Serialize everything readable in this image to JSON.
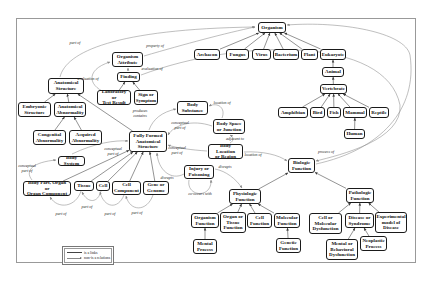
{
  "colors": {
    "box_border": "#1a1a1a",
    "isa_line": "#3a3a3a",
    "rel_line": "#8a8a8a",
    "frame": "#999999"
  },
  "nodes": [
    {
      "id": "organism",
      "label": "Organism",
      "x": 258,
      "y": 22,
      "w": 28,
      "h": 11
    },
    {
      "id": "archaeon",
      "label": "Archaeon",
      "x": 194,
      "y": 49,
      "w": 26,
      "h": 11
    },
    {
      "id": "fungus",
      "label": "Fungus",
      "x": 226,
      "y": 49,
      "w": 23,
      "h": 11
    },
    {
      "id": "virus",
      "label": "Virus",
      "x": 252,
      "y": 49,
      "w": 19,
      "h": 11
    },
    {
      "id": "bacterium",
      "label": "Bacterium",
      "x": 273,
      "y": 49,
      "w": 26,
      "h": 11
    },
    {
      "id": "plant",
      "label": "Plant",
      "x": 301,
      "y": 49,
      "w": 17,
      "h": 11
    },
    {
      "id": "eukaryote",
      "label": "Eukaryote",
      "x": 320,
      "y": 49,
      "w": 26,
      "h": 11
    },
    {
      "id": "animal",
      "label": "Animal",
      "x": 322,
      "y": 67,
      "w": 22,
      "h": 10
    },
    {
      "id": "vertebrate",
      "label": "Vertebrate",
      "x": 320,
      "y": 84,
      "w": 27,
      "h": 10
    },
    {
      "id": "amphibian",
      "label": "Amphibian",
      "x": 278,
      "y": 107,
      "w": 30,
      "h": 11
    },
    {
      "id": "bird",
      "label": "Bird",
      "x": 310,
      "y": 107,
      "w": 15,
      "h": 11
    },
    {
      "id": "fish",
      "label": "Fish",
      "x": 327,
      "y": 107,
      "w": 14,
      "h": 11
    },
    {
      "id": "mammal",
      "label": "Mammal",
      "x": 343,
      "y": 107,
      "w": 24,
      "h": 11
    },
    {
      "id": "reptile",
      "label": "Reptile",
      "x": 369,
      "y": 107,
      "w": 20,
      "h": 11
    },
    {
      "id": "human",
      "label": "Human",
      "x": 344,
      "y": 129,
      "w": 21,
      "h": 10
    },
    {
      "id": "anatomical-structure",
      "label": "Anatomical\nStructure",
      "x": 48,
      "y": 78,
      "w": 36,
      "h": 16
    },
    {
      "id": "organism-attribute",
      "label": "Organism\nAttribute",
      "x": 112,
      "y": 52,
      "w": 31,
      "h": 15
    },
    {
      "id": "finding",
      "label": "Finding",
      "x": 117,
      "y": 72,
      "w": 23,
      "h": 10
    },
    {
      "id": "lab-test",
      "label": "Laboratory or\nTest Result",
      "x": 97,
      "y": 90,
      "w": 34,
      "h": 15
    },
    {
      "id": "sign-symptom",
      "label": "Sign or\nSymptom",
      "x": 134,
      "y": 90,
      "w": 24,
      "h": 15
    },
    {
      "id": "embryonic",
      "label": "Embryonic\nStructure",
      "x": 18,
      "y": 102,
      "w": 33,
      "h": 15
    },
    {
      "id": "anat-abnormality",
      "label": "Anatomical\nAbnormality",
      "x": 54,
      "y": 102,
      "w": 32,
      "h": 15
    },
    {
      "id": "congenital",
      "label": "Congenital\nAbnormality",
      "x": 33,
      "y": 130,
      "w": 33,
      "h": 15
    },
    {
      "id": "acquired",
      "label": "Acquired\nAbnormality",
      "x": 69,
      "y": 130,
      "w": 33,
      "h": 15
    },
    {
      "id": "ffas",
      "label": "Fully Formed\nAnatomical\nStructure",
      "x": 129,
      "y": 131,
      "w": 38,
      "h": 21
    },
    {
      "id": "body-substance",
      "label": "Body\nSubstance",
      "x": 177,
      "y": 101,
      "w": 31,
      "h": 14
    },
    {
      "id": "body-space",
      "label": "Body Space\nor Junction",
      "x": 213,
      "y": 119,
      "w": 32,
      "h": 15
    },
    {
      "id": "body-location",
      "label": "Body Location\nor Region",
      "x": 208,
      "y": 144,
      "w": 35,
      "h": 15
    },
    {
      "id": "body-system",
      "label": "Body System",
      "x": 58,
      "y": 156,
      "w": 27,
      "h": 10
    },
    {
      "id": "body-part",
      "label": "Body Part, Organ or\nOrgan Component",
      "x": 23,
      "y": 181,
      "w": 48,
      "h": 15
    },
    {
      "id": "tissue",
      "label": "Tissue",
      "x": 74,
      "y": 181,
      "w": 20,
      "h": 10
    },
    {
      "id": "cell",
      "label": "Cell",
      "x": 96,
      "y": 181,
      "w": 14,
      "h": 10
    },
    {
      "id": "cell-component",
      "label": "Cell\nComponent",
      "x": 112,
      "y": 181,
      "w": 29,
      "h": 14
    },
    {
      "id": "gene",
      "label": "Gene or\nGenome",
      "x": 143,
      "y": 181,
      "w": 26,
      "h": 14
    },
    {
      "id": "injury",
      "label": "Injury or\nPoisoning",
      "x": 184,
      "y": 165,
      "w": 30,
      "h": 14
    },
    {
      "id": "biologic-function",
      "label": "Biologic\nFunction",
      "x": 288,
      "y": 158,
      "w": 27,
      "h": 15
    },
    {
      "id": "physiologic",
      "label": "Physiologic\nFunction",
      "x": 229,
      "y": 189,
      "w": 32,
      "h": 15
    },
    {
      "id": "pathologic",
      "label": "Pathologic\nFunction",
      "x": 346,
      "y": 188,
      "w": 28,
      "h": 15
    },
    {
      "id": "organism-function",
      "label": "Organism\nFunction",
      "x": 191,
      "y": 213,
      "w": 28,
      "h": 15
    },
    {
      "id": "organ-tissue-function",
      "label": "Organ or\nTissue\nFunction",
      "x": 220,
      "y": 212,
      "w": 26,
      "h": 21
    },
    {
      "id": "cell-function",
      "label": "Cell\nFunction",
      "x": 247,
      "y": 213,
      "w": 25,
      "h": 15
    },
    {
      "id": "molecular-function",
      "label": "Molecular\nFunction",
      "x": 274,
      "y": 213,
      "w": 26,
      "h": 15
    },
    {
      "id": "mental-process",
      "label": "Mental\nProcess",
      "x": 193,
      "y": 239,
      "w": 24,
      "h": 15
    },
    {
      "id": "genetic-function",
      "label": "Genetic\nFunction",
      "x": 276,
      "y": 238,
      "w": 25,
      "h": 15
    },
    {
      "id": "cell-mol-dys",
      "label": "Cell or\nMolecular\nDysfunction",
      "x": 309,
      "y": 213,
      "w": 33,
      "h": 21
    },
    {
      "id": "disease-syndrome",
      "label": "Disease or\nSyndrome",
      "x": 345,
      "y": 213,
      "w": 29,
      "h": 15
    },
    {
      "id": "exp-model",
      "label": "Experimental\nmodel of\nDisease",
      "x": 375,
      "y": 212,
      "w": 32,
      "h": 21
    },
    {
      "id": "mental-behavioral",
      "label": "Mental or\nBehavioral\nDysfunction",
      "x": 326,
      "y": 239,
      "w": 32,
      "h": 21
    },
    {
      "id": "neoplastic",
      "label": "Neoplastic\nProcess",
      "x": 360,
      "y": 236,
      "w": 27,
      "h": 15
    }
  ],
  "is_a_edges": [
    [
      "archaeon",
      "organism"
    ],
    [
      "fungus",
      "organism"
    ],
    [
      "virus",
      "organism"
    ],
    [
      "bacterium",
      "organism"
    ],
    [
      "plant",
      "organism"
    ],
    [
      "eukaryote",
      "organism"
    ],
    [
      "animal",
      "eukaryote"
    ],
    [
      "vertebrate",
      "animal"
    ],
    [
      "amphibian",
      "vertebrate"
    ],
    [
      "bird",
      "vertebrate"
    ],
    [
      "fish",
      "vertebrate"
    ],
    [
      "mammal",
      "vertebrate"
    ],
    [
      "reptile",
      "vertebrate"
    ],
    [
      "human",
      "mammal"
    ],
    [
      "embryonic",
      "anatomical-structure"
    ],
    [
      "anat-abnormality",
      "anatomical-structure"
    ],
    [
      "ffas",
      "anatomical-structure"
    ],
    [
      "congenital",
      "anat-abnormality"
    ],
    [
      "acquired",
      "anat-abnormality"
    ],
    [
      "lab-test",
      "finding"
    ],
    [
      "sign-symptom",
      "finding"
    ],
    [
      "body-part",
      "ffas"
    ],
    [
      "tissue",
      "ffas"
    ],
    [
      "cell",
      "ffas"
    ],
    [
      "cell-component",
      "ffas"
    ],
    [
      "gene",
      "ffas"
    ],
    [
      "physiologic",
      "biologic-function"
    ],
    [
      "pathologic",
      "biologic-function"
    ],
    [
      "organism-function",
      "physiologic"
    ],
    [
      "organ-tissue-function",
      "physiologic"
    ],
    [
      "cell-function",
      "physiologic"
    ],
    [
      "molecular-function",
      "physiologic"
    ],
    [
      "mental-process",
      "organism-function"
    ],
    [
      "genetic-function",
      "molecular-function"
    ],
    [
      "cell-mol-dys",
      "pathologic"
    ],
    [
      "disease-syndrome",
      "pathologic"
    ],
    [
      "exp-model",
      "pathologic"
    ],
    [
      "mental-behavioral",
      "disease-syndrome"
    ],
    [
      "neoplastic",
      "disease-syndrome"
    ]
  ],
  "relations": [
    {
      "label": "part of",
      "lx": 75,
      "ly": 43,
      "path": "M 60 77 C 66 52, 115 29, 255 27"
    },
    {
      "label": "property of",
      "lx": 155,
      "ly": 46,
      "path": "M 144 56 C 185 44, 226 33, 255 27"
    },
    {
      "label": "evaluation of",
      "lx": 88,
      "ly": 79,
      "path": "M 110 94 C 88 88, 84 70, 110 62"
    },
    {
      "label": "evaluation of",
      "lx": 152,
      "ly": 69,
      "path": "M 141 75 C 240 38, 386 36, 400 105 C 403 140, 340 155, 316 161"
    },
    {
      "label": "",
      "lx": 0,
      "ly": 0,
      "path": "M 128 71 L 128 68"
    },
    {
      "label": "produces\ncontains",
      "lx": 140,
      "ly": 114,
      "path": "M 149 130 C 153 119, 162 112, 176 109"
    },
    {
      "label": "location of",
      "lx": 222,
      "ly": 103,
      "path": "M 222 118 C 226 108, 218 102, 209 106"
    },
    {
      "label": "adjacent to",
      "lx": 235,
      "ly": 139,
      "path": "M 230 143 C 234 141, 234 137, 230 135"
    },
    {
      "label": "conceptual\npart of",
      "lx": 180,
      "ly": 126,
      "path": "M 212 126 C 192 119, 174 125, 168 135"
    },
    {
      "label": "conceptual\npart of",
      "lx": 177,
      "ly": 151,
      "path": "M 207 151 C 192 150, 176 148, 168 145"
    },
    {
      "label": "conceptual\npart of",
      "lx": 113,
      "ly": 152,
      "path": "M 72 154 C 95 143, 115 140, 128 141"
    },
    {
      "label": "conceptual\npart of",
      "lx": 27,
      "ly": 169,
      "path": "M 32 180 C 24 170, 34 162, 56 160"
    },
    {
      "label": "part of",
      "lx": 61,
      "ly": 214,
      "path": "M 81 191 C 76 207, 58 210, 50 197"
    },
    {
      "label": "part of",
      "lx": 87,
      "ly": 207,
      "path": "M 101 191 C 98 203, 88 204, 82 192"
    },
    {
      "label": "part of",
      "lx": 110,
      "ly": 214,
      "path": "M 124 195 C 118 210, 104 208, 100 192"
    },
    {
      "label": "part of",
      "lx": 137,
      "ly": 213,
      "path": "M 153 195 C 147 212, 130 212, 126 196"
    },
    {
      "label": "disrupts",
      "lx": 167,
      "ly": 178,
      "path": "M 184 174 C 171 181, 158 170, 157 153"
    },
    {
      "label": "disrupts",
      "lx": 225,
      "ly": 167,
      "path": "M 215 169 C 226 171, 236 179, 242 188"
    },
    {
      "label": "co-occurs with",
      "lx": 200,
      "ly": 194,
      "path": "M 189 180 C 186 197, 212 199, 211 180"
    },
    {
      "label": "location of",
      "lx": 253,
      "ly": 155,
      "path": "M 244 152 C 263 151, 279 155, 287 161"
    },
    {
      "label": "process of",
      "lx": 326,
      "ly": 152,
      "path": "M 316 164 C 380 150, 418 110, 410 55 C 405 32, 340 21, 287 25"
    }
  ],
  "legend": {
    "items": [
      {
        "symbol": "solid-line",
        "label": "is a links"
      },
      {
        "symbol": "arrow-line",
        "label": "non-is a relations"
      }
    ]
  }
}
